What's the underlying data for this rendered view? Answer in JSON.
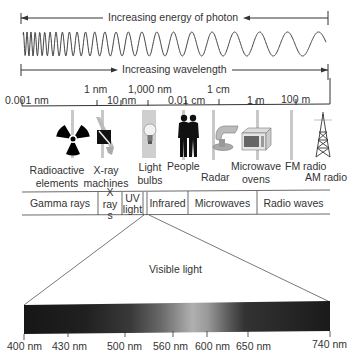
{
  "arrows": {
    "energy": "Increasing energy of photon",
    "wavelength": "Increasing wavelength"
  },
  "scale": [
    {
      "label": "0.001 nm",
      "row": "low"
    },
    {
      "label": "1 nm",
      "row": "high"
    },
    {
      "label": "10 nm",
      "row": "low"
    },
    {
      "label": "1,000 nm",
      "row": "high"
    },
    {
      "label": "0.01 cm",
      "row": "low"
    },
    {
      "label": "1 cm",
      "row": "high"
    },
    {
      "label": "1 m",
      "row": "low"
    },
    {
      "label": "100 m",
      "row": "low"
    }
  ],
  "sources": [
    {
      "icon": "radioactive-icon",
      "lines": [
        "Radioactive",
        "elements"
      ]
    },
    {
      "icon": "xray-machine-icon",
      "lines": [
        "X-ray",
        "machines"
      ]
    },
    {
      "icon": "light-bulb-icon",
      "lines": [
        "Light",
        "bulbs"
      ]
    },
    {
      "icon": "people-icon",
      "lines": [
        "People"
      ]
    },
    {
      "icon": "radar-icon",
      "lines": [
        "Radar"
      ]
    },
    {
      "icon": "microwave-oven-icon",
      "lines": [
        "Microwave",
        "ovens"
      ]
    },
    {
      "icon": "fm-radio-icon",
      "lines": [
        "FM radio"
      ]
    },
    {
      "icon": "radio-tower-icon",
      "lines": [
        "AM radio"
      ]
    }
  ],
  "bands": [
    {
      "label": "Gamma rays"
    },
    {
      "label": "X rays"
    },
    {
      "label": "UV light"
    },
    {
      "label": "Infrared"
    },
    {
      "label": "Microwaves"
    },
    {
      "label": "Radio waves"
    }
  ],
  "visible": {
    "title": "Visible light",
    "ticks": [
      "400 nm",
      "430 nm",
      "500 nm",
      "560 nm",
      "600 nm",
      "650 nm",
      "740 nm"
    ]
  }
}
